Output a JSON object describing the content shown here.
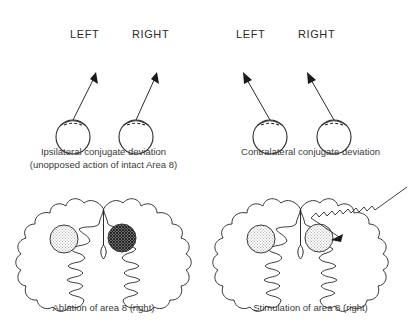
{
  "figure": {
    "background_color": "#ffffff",
    "ink_color": "#2b2b2b"
  },
  "panels": [
    {
      "id": "ipsilateral",
      "direction_labels": {
        "left": "LEFT",
        "right": "RIGHT"
      },
      "caption_line1": "Ipsilateral conjugate deviation",
      "caption_line2": "(unopposed action of intact Area 8)",
      "eyes": [
        {
          "name": "left-eye",
          "gaze": "up-right"
        },
        {
          "name": "right-eye",
          "gaze": "up-right"
        }
      ],
      "gaze_direction": "right"
    },
    {
      "id": "contralateral",
      "direction_labels": {
        "left": "LEFT",
        "right": "RIGHT"
      },
      "caption_line1": "Contralateral conjugate deviation",
      "caption_line2": "",
      "eyes": [
        {
          "name": "left-eye",
          "gaze": "up-left"
        },
        {
          "name": "right-eye",
          "gaze": "up-left"
        }
      ],
      "gaze_direction": "left"
    },
    {
      "id": "ablation",
      "caption_line1": "Ablation of area 8 (right)",
      "caption_line2": "",
      "lesions": [
        {
          "name": "left-hemisphere-area-8",
          "shading": "stipple-light",
          "color": "#cfcfcf"
        },
        {
          "name": "right-hemisphere-area-8",
          "shading": "crosshatch-dark",
          "color": "#4a4a4a"
        }
      ],
      "electrode": false
    },
    {
      "id": "stimulation",
      "caption_line1": "Stimulation of area 8 (right)",
      "caption_line2": "",
      "lesions": [
        {
          "name": "left-hemisphere-area-8",
          "shading": "stipple-light",
          "color": "#cfcfcf"
        },
        {
          "name": "right-hemisphere-area-8",
          "shading": "stipple-light",
          "color": "#cfcfcf"
        }
      ],
      "electrode": true,
      "electrode_label": ""
    }
  ]
}
